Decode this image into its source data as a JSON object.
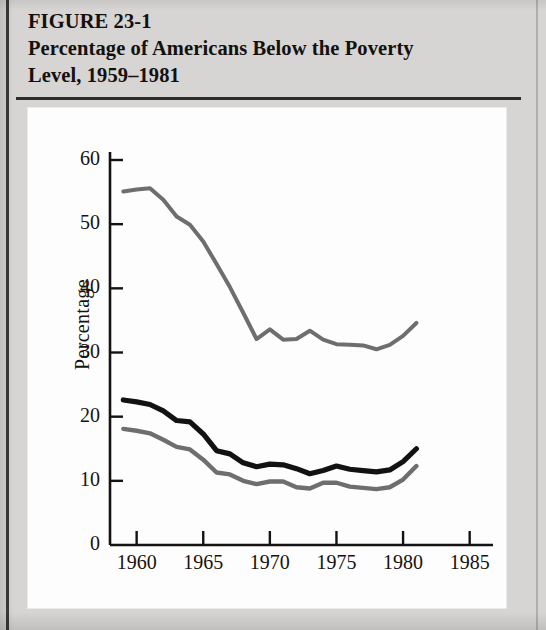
{
  "figure": {
    "label": "FIGURE 23-1",
    "caption_line_1": "Percentage of Americans Below the Poverty",
    "caption_line_2": "Level, 1959–1981"
  },
  "colors": {
    "page_background": "#d6d5d3",
    "panel_background": "#fdfdfd",
    "axis": "#151312",
    "line_black": "#121212",
    "line_gray": "#6e6e6e",
    "text": "#17120f"
  },
  "chart_data": {
    "type": "line",
    "title": "Percentage of Americans Below the Poverty Level, 1959–1981",
    "xlabel": "",
    "ylabel": "Percentage",
    "xlim": [
      1958,
      1986
    ],
    "ylim": [
      0,
      60
    ],
    "grid": false,
    "legend": "none",
    "xticks": [
      1960,
      1965,
      1970,
      1975,
      1980,
      1985
    ],
    "xtick_labels": [
      "1960",
      "1965",
      "1970",
      "1975",
      "1980",
      "1985"
    ],
    "yticks": [
      0,
      10,
      20,
      30,
      40,
      50,
      60
    ],
    "ytick_labels": [
      "0",
      "10",
      "20",
      "30",
      "40",
      "50",
      "60"
    ],
    "x": [
      1959,
      1960,
      1961,
      1962,
      1963,
      1964,
      1965,
      1966,
      1967,
      1968,
      1969,
      1970,
      1971,
      1972,
      1973,
      1974,
      1975,
      1976,
      1977,
      1978,
      1979,
      1980,
      1981
    ],
    "series": [
      {
        "name": "upper-gray-line",
        "color": "#6e6e6e",
        "width": 4.0,
        "values": [
          55.1,
          55.4,
          55.6,
          53.8,
          51.2,
          49.9,
          47.3,
          43.8,
          40.2,
          36.2,
          32.1,
          33.6,
          32.0,
          32.1,
          33.4,
          32.0,
          31.3,
          31.2,
          31.1,
          30.5,
          31.2,
          32.6,
          34.6
        ]
      },
      {
        "name": "middle-black-line",
        "color": "#121212",
        "width": 5.2,
        "values": [
          22.6,
          22.3,
          21.9,
          20.9,
          19.4,
          19.2,
          17.3,
          14.7,
          14.2,
          12.8,
          12.2,
          12.6,
          12.5,
          11.9,
          11.1,
          11.6,
          12.3,
          11.8,
          11.6,
          11.4,
          11.7,
          13.0,
          15.0
        ]
      },
      {
        "name": "lower-gray-line",
        "color": "#6e6e6e",
        "width": 4.4,
        "values": [
          18.1,
          17.8,
          17.4,
          16.4,
          15.3,
          14.9,
          13.3,
          11.3,
          11.0,
          10.0,
          9.5,
          9.9,
          9.9,
          9.0,
          8.8,
          9.7,
          9.7,
          9.1,
          8.9,
          8.7,
          9.0,
          10.2,
          12.3
        ]
      }
    ]
  }
}
